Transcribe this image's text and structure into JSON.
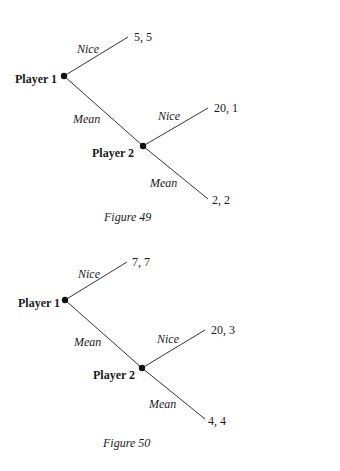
{
  "figures": [
    {
      "caption": "Figure 49",
      "player1": "Player 1",
      "player2": "Player 2",
      "p1_nice_label": "Nice",
      "p1_mean_label": "Mean",
      "p2_nice_label": "Nice",
      "p2_mean_label": "Mean",
      "payoff_p1_nice": "5, 5",
      "payoff_p2_nice": "20, 1",
      "payoff_p2_mean": "2, 2"
    },
    {
      "caption": "Figure 50",
      "player1": "Player 1",
      "player2": "Player 2",
      "p1_nice_label": "Nice",
      "p1_mean_label": "Mean",
      "p2_nice_label": "Nice",
      "p2_mean_label": "Mean",
      "payoff_p1_nice": "7, 7",
      "payoff_p2_nice": "20, 3",
      "payoff_p2_mean": "4, 4"
    }
  ]
}
